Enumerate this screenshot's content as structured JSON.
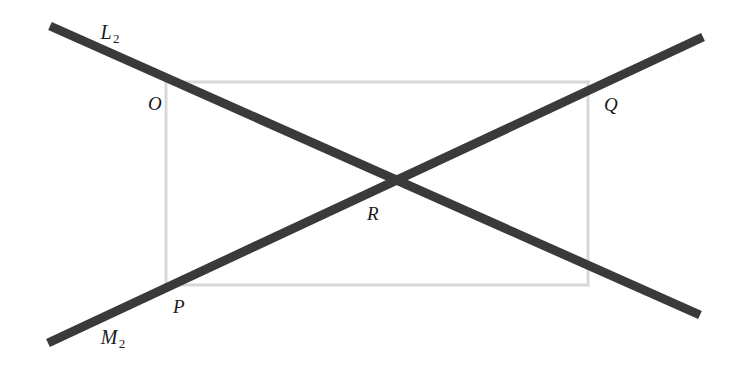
{
  "figure": {
    "width": 745,
    "height": 369,
    "background_color": "#ffffff",
    "line_color": "#3a3a3a",
    "rectangle_color": "#d8d8d8",
    "label_color": "#1a1a1a",
    "line_thickness": 9,
    "rectangle_thickness": 3
  },
  "lines": [
    {
      "name": "L2",
      "label_main": "L",
      "label_sub": "2",
      "label_x": 110,
      "label_y": 33,
      "x1": 50,
      "y1": 26,
      "x2": 700,
      "y2": 315
    },
    {
      "name": "M2",
      "label_main": "M",
      "label_sub": "2",
      "label_x": 113,
      "label_y": 338,
      "x1": 48,
      "y1": 343,
      "x2": 703,
      "y2": 37
    }
  ],
  "points": [
    {
      "name": "O",
      "label": "O",
      "label_x": 155,
      "label_y": 103,
      "x": 166,
      "y": 82
    },
    {
      "name": "Q",
      "label": "Q",
      "label_x": 611,
      "label_y": 104,
      "x": 588,
      "y": 82
    },
    {
      "name": "P",
      "label": "P",
      "label_x": 179,
      "label_y": 306,
      "x": 166,
      "y": 285
    },
    {
      "name": "R",
      "label": "R",
      "label_x": 373,
      "label_y": 213,
      "x": 378,
      "y": 185
    }
  ],
  "rectangle": {
    "name": "reference-rectangle",
    "left": 166,
    "top": 82,
    "right": 588,
    "bottom": 285
  }
}
